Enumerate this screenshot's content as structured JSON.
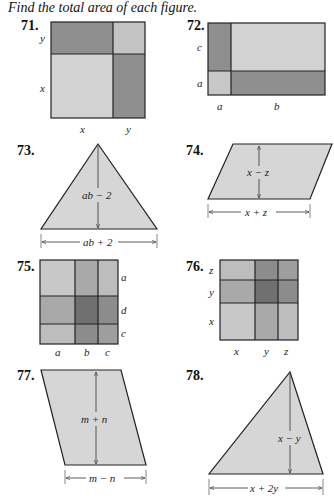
{
  "instruction": "Find the total area of each figure.",
  "colors": {
    "light": "#d2d2d2",
    "medium": "#a9a9a9",
    "dark": "#8c8c8c",
    "darkest": "#757575",
    "shape_fill": "#d6d6d6",
    "stroke": "#222222"
  },
  "problems": [
    {
      "number": "71.",
      "type": "square-partition",
      "side_labels": [
        "y",
        "x"
      ],
      "bottom_labels": [
        "x",
        "y"
      ]
    },
    {
      "number": "72.",
      "type": "rectangle-partition",
      "side_labels": [
        "c",
        "a"
      ],
      "bottom_labels": [
        "a",
        "b"
      ]
    },
    {
      "number": "73.",
      "type": "triangle",
      "height_label": "ab − 2",
      "base_label": "ab + 2"
    },
    {
      "number": "74.",
      "type": "parallelogram",
      "height_label": "x − z",
      "base_label": "x + z"
    },
    {
      "number": "75.",
      "type": "grid-3x3",
      "side_labels": [
        "a",
        "d",
        "c"
      ],
      "bottom_labels": [
        "a",
        "b",
        "c"
      ]
    },
    {
      "number": "76.",
      "type": "grid-3x3",
      "side_labels": [
        "z",
        "y",
        "x"
      ],
      "bottom_labels": [
        "x",
        "y",
        "z"
      ]
    },
    {
      "number": "77.",
      "type": "parallelogram",
      "height_label": "m + n",
      "base_label": "m − n"
    },
    {
      "number": "78.",
      "type": "triangle",
      "height_label": "x − y",
      "base_label": "x + 2y"
    }
  ]
}
